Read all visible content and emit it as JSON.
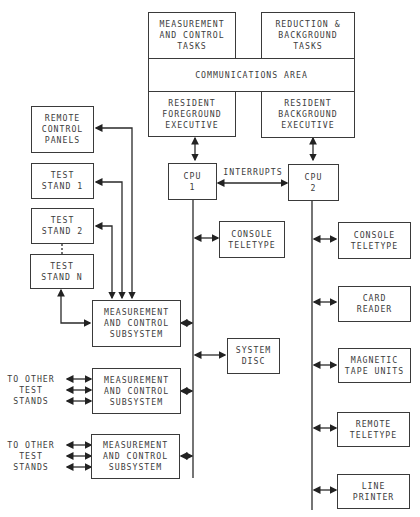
{
  "diagram": {
    "top_block": {
      "measurement_tasks": "MEASUREMENT\nAND CONTROL\nTASKS",
      "reduction_tasks": "REDUCTION &\nBACKGROUND\nTASKS",
      "communications": "COMMUNICATIONS AREA",
      "foreground_exec": "RESIDENT\nFOREGROUND\nEXECUTIVE",
      "background_exec": "RESIDENT\nBACKGROUND\nEXECUTIVE"
    },
    "cpu1": "CPU\n1",
    "cpu2": "CPU\n2",
    "interrupts": "INTERRUPTS",
    "left_devices": {
      "remote_panels": "REMOTE\nCONTROL\nPANELS",
      "test_stand_1": "TEST\nSTAND 1",
      "test_stand_2": "TEST\nSTAND 2",
      "test_stand_n": "TEST\nSTAND N"
    },
    "subsystems": [
      "MEASUREMENT\nAND CONTROL\nSUBSYSTEM",
      "MEASUREMENT\nAND CONTROL\nSUBSYSTEM",
      "MEASUREMENT\nAND CONTROL\nSUBSYSTEM"
    ],
    "other_stands": [
      "TO OTHER\nTEST\nSTANDS",
      "TO OTHER\nTEST\nSTANDS"
    ],
    "cpu1_devices": [
      "CONSOLE\nTELETYPE",
      "SYSTEM\nDISC"
    ],
    "cpu2_devices": [
      "CONSOLE\nTELETYPE",
      "CARD\nREADER",
      "MAGNETIC\nTAPE UNITS",
      "REMOTE\nTELETYPE",
      "LINE\nPRINTER"
    ]
  }
}
